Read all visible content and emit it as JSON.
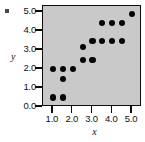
{
  "chart_data": {
    "type": "scatter",
    "title": "",
    "xlabel": "x",
    "ylabel": "y",
    "xlim": [
      0.5,
      5.5
    ],
    "ylim": [
      0.0,
      5.3
    ],
    "grid": false,
    "legend": null,
    "xticks": [
      "1.0",
      "2.0",
      "3.0",
      "4.0",
      "5.0"
    ],
    "xtick_values": [
      1.0,
      2.0,
      3.0,
      4.0,
      5.0
    ],
    "yticks": [
      "0.0",
      "1.0",
      "2.0",
      "3.0",
      "4.0",
      "5.0"
    ],
    "ytick_values": [
      0.0,
      1.0,
      2.0,
      3.0,
      4.0,
      5.0
    ],
    "marker": "filled-circle",
    "marker_color": "#050505",
    "panel_color": "#c9c9c9",
    "frame_color": "#0d0d0d",
    "points": [
      {
        "x": 1.0,
        "y": 0.5
      },
      {
        "x": 1.5,
        "y": 0.5
      },
      {
        "x": 1.5,
        "y": 1.45
      },
      {
        "x": 1.0,
        "y": 2.0
      },
      {
        "x": 1.5,
        "y": 2.0
      },
      {
        "x": 2.0,
        "y": 2.0
      },
      {
        "x": 2.5,
        "y": 2.45
      },
      {
        "x": 3.0,
        "y": 2.45
      },
      {
        "x": 2.5,
        "y": 3.15
      },
      {
        "x": 3.0,
        "y": 3.45
      },
      {
        "x": 3.5,
        "y": 3.45
      },
      {
        "x": 4.0,
        "y": 3.45
      },
      {
        "x": 4.5,
        "y": 3.45
      },
      {
        "x": 3.5,
        "y": 4.4
      },
      {
        "x": 4.0,
        "y": 4.4
      },
      {
        "x": 4.5,
        "y": 4.4
      },
      {
        "x": 5.0,
        "y": 4.9
      }
    ]
  }
}
